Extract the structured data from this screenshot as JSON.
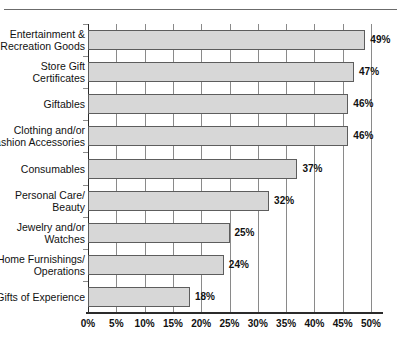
{
  "chart_data": {
    "type": "bar",
    "orientation": "horizontal",
    "title": "",
    "subtitle": "",
    "xlabel": "",
    "ylabel": "",
    "xlim": [
      0,
      50
    ],
    "grid": true,
    "legend": null,
    "categories": [
      "Entertainment &\nRecreation Goods",
      "Store Gift\nCertificates",
      "Giftables",
      "Clothing and/or\nFashion Accessories",
      "Consumables",
      "Personal Care/\nBeauty",
      "Jewelry and/or\nWatches",
      "Home Furnishings/\nOperations",
      "Gifts of Experience"
    ],
    "values": [
      49,
      47,
      46,
      46,
      37,
      32,
      25,
      24,
      18
    ],
    "data_labels": [
      "49%",
      "47%",
      "46%",
      "46%",
      "37%",
      "32%",
      "25%",
      "24%",
      "18%"
    ],
    "xticks": [
      0,
      5,
      10,
      15,
      20,
      25,
      30,
      35,
      40,
      45,
      50
    ],
    "xtick_labels": [
      "0%",
      "5%",
      "10%",
      "15%",
      "20%",
      "25%",
      "30%",
      "35%",
      "40%",
      "45%",
      "50%"
    ],
    "colors": {
      "bar_fill": "#d7d7d7",
      "bar_stroke": "#5d5d5d",
      "gridline": "#8a8a8a",
      "axis": "#2b2b2b",
      "text": "#111111",
      "top_rule": "#6b6b6b",
      "background": "#ffffff"
    }
  }
}
